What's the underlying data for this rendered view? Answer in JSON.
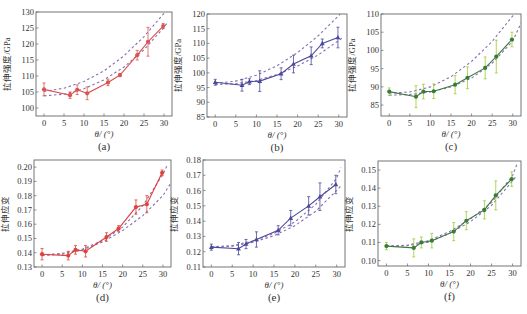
{
  "figure": {
    "xlabel": "θ/ (°)",
    "x_ticks": [
      0,
      5,
      10,
      15,
      20,
      25,
      30
    ],
    "x_range": [
      -2,
      32
    ]
  },
  "chart_data": [
    {
      "id": "a",
      "type": "line",
      "panel_label": "(a)",
      "ylabel": "拉伸强度/GPa",
      "xlabel": "θ/ (°)",
      "ylim": [
        97.5,
        130
      ],
      "y_ticks": [
        100,
        105,
        110,
        115,
        120,
        125,
        130
      ],
      "y_tick_decimals": 0,
      "color": "#d9534f",
      "marker": "circle",
      "frame": {
        "x": 36,
        "y": 12,
        "w": 136,
        "h": 104
      },
      "series": [
        {
          "name": "measured",
          "x": [
            0,
            6.5,
            8.3,
            10.8,
            16,
            19,
            23.3,
            26,
            29.8
          ],
          "values": [
            105.8,
            104.0,
            105.7,
            104.6,
            108.0,
            110.3,
            116.5,
            120.7,
            125.6
          ],
          "errors": [
            2.0,
            1.0,
            1.5,
            2.0,
            1.0,
            0.5,
            1.5,
            4.5,
            0.8
          ]
        },
        {
          "name": "fit-upper",
          "style": "dashed",
          "x": [
            0,
            5,
            10,
            15,
            20,
            25,
            30,
            31
          ],
          "values": [
            105.2,
            106.2,
            108.3,
            111.6,
            116.3,
            122.3,
            129.6,
            131
          ]
        },
        {
          "name": "fit-lower",
          "style": "dashed",
          "x": [
            0,
            5,
            10,
            15,
            20,
            25,
            30,
            31
          ],
          "values": [
            103.8,
            104.3,
            106.0,
            108.8,
            112.8,
            118.2,
            125.2,
            127
          ]
        }
      ]
    },
    {
      "id": "b",
      "type": "line",
      "panel_label": "(b)",
      "ylabel": "拉伸强度/GPa",
      "xlabel": "θ/ (°)",
      "ylim": [
        85,
        120
      ],
      "y_ticks": [
        85,
        90,
        95,
        100,
        105,
        110,
        115,
        120
      ],
      "y_tick_decimals": 0,
      "color": "#4a4a9c",
      "marker": "triangle",
      "frame": {
        "x": 207,
        "y": 14,
        "w": 140,
        "h": 103
      },
      "series": [
        {
          "name": "measured",
          "x": [
            0,
            6.5,
            8.3,
            10.8,
            16,
            19,
            23.3,
            26,
            29.8
          ],
          "values": [
            96.8,
            95.8,
            97.0,
            97.2,
            99.7,
            103.0,
            105.8,
            110.0,
            112.0
          ],
          "errors": [
            1.0,
            2.0,
            1.0,
            3.5,
            2.0,
            3.0,
            3.0,
            1.5,
            3.5
          ]
        },
        {
          "name": "fit-upper",
          "style": "dashed",
          "x": [
            0,
            5,
            10,
            15,
            20,
            25,
            30,
            31
          ],
          "values": [
            96.5,
            97.2,
            99.2,
            102.4,
            106.9,
            112.6,
            119.5,
            121
          ]
        },
        {
          "name": "fit-lower",
          "style": "dashed",
          "x": [
            0,
            5,
            10,
            15,
            20,
            25,
            30,
            31
          ],
          "values": [
            96.0,
            96.3,
            97.4,
            99.4,
            102.3,
            106.1,
            111.0,
            112
          ]
        }
      ]
    },
    {
      "id": "c",
      "type": "line",
      "panel_label": "(c)",
      "ylabel": "拉伸强度/GPa",
      "xlabel": "θ/ (°)",
      "ylim": [
        82,
        110
      ],
      "y_ticks": [
        85,
        90,
        95,
        100,
        105,
        110
      ],
      "y_tick_decimals": 0,
      "color": "#3a7a3a",
      "errcolor": "#9acd32",
      "marker": "circle",
      "frame": {
        "x": 381,
        "y": 14,
        "w": 140,
        "h": 102
      },
      "series": [
        {
          "name": "measured",
          "x": [
            0,
            6.5,
            8.3,
            10.8,
            16,
            19,
            23.3,
            26,
            29.8
          ],
          "values": [
            88.7,
            87.3,
            88.7,
            88.8,
            90.6,
            92.5,
            95.2,
            98.3,
            103.0
          ],
          "errors": [
            1.0,
            3.0,
            2.0,
            2.0,
            2.5,
            3.0,
            3.0,
            4.5,
            2.0
          ]
        },
        {
          "name": "fit-upper",
          "style": "dashed",
          "x": [
            0,
            5,
            10,
            15,
            20,
            25,
            30,
            31
          ],
          "values": [
            88.3,
            88.6,
            90.0,
            92.8,
            97.0,
            102.5,
            109.5,
            111
          ]
        },
        {
          "name": "fit-lower",
          "style": "dashed",
          "x": [
            0,
            5,
            10,
            15,
            20,
            25,
            30,
            32
          ],
          "values": [
            87.7,
            87.9,
            88.6,
            90.0,
            92.4,
            96.5,
            102.6,
            107.5
          ]
        }
      ]
    },
    {
      "id": "d",
      "type": "line",
      "panel_label": "(d)",
      "ylabel": "拉伸应变",
      "xlabel": "θ/ (°)",
      "ylim": [
        0.13,
        0.205
      ],
      "y_ticks": [
        0.13,
        0.14,
        0.15,
        0.16,
        0.17,
        0.18,
        0.19,
        0.2
      ],
      "y_tick_decimals": 2,
      "color": "#e0413a",
      "marker": "circle",
      "frame": {
        "x": 34,
        "y": 160,
        "w": 137,
        "h": 107
      },
      "series": [
        {
          "name": "measured",
          "x": [
            0,
            6.5,
            8.3,
            10.8,
            16,
            19,
            23.3,
            26,
            29.8
          ],
          "values": [
            0.139,
            0.138,
            0.142,
            0.141,
            0.151,
            0.157,
            0.172,
            0.174,
            0.196
          ],
          "errors": [
            0.004,
            0.003,
            0.003,
            0.004,
            0.003,
            0.002,
            0.005,
            0.006,
            0.002
          ]
        },
        {
          "name": "fit-upper",
          "style": "dashed",
          "x": [
            0,
            5,
            10,
            15,
            20,
            25,
            30,
            31
          ],
          "values": [
            0.1385,
            0.1395,
            0.1425,
            0.1485,
            0.158,
            0.173,
            0.195,
            0.201
          ]
        },
        {
          "name": "fit-lower",
          "style": "dashed",
          "x": [
            0,
            5,
            10,
            15,
            20,
            25,
            30,
            32
          ],
          "values": [
            0.138,
            0.139,
            0.142,
            0.1475,
            0.1555,
            0.166,
            0.18,
            0.189
          ]
        }
      ]
    },
    {
      "id": "e",
      "type": "line",
      "panel_label": "(e)",
      "ylabel": "拉伸应变",
      "xlabel": "θ/ (°)",
      "ylim": [
        0.11,
        0.18
      ],
      "y_ticks": [
        0.11,
        0.12,
        0.13,
        0.14,
        0.15,
        0.16,
        0.17,
        0.18
      ],
      "y_tick_decimals": 2,
      "color": "#4a4a9c",
      "marker": "triangle",
      "frame": {
        "x": 203,
        "y": 160,
        "w": 142,
        "h": 107
      },
      "series": [
        {
          "name": "measured",
          "x": [
            0,
            6.5,
            8.3,
            10.8,
            16,
            19,
            23.3,
            26,
            29.8
          ],
          "values": [
            0.123,
            0.122,
            0.125,
            0.128,
            0.134,
            0.142,
            0.15,
            0.156,
            0.164
          ],
          "errors": [
            0.002,
            0.004,
            0.003,
            0.005,
            0.003,
            0.005,
            0.006,
            0.009,
            0.006
          ]
        },
        {
          "name": "fit-upper",
          "style": "dashed",
          "x": [
            0,
            5,
            10,
            15,
            20,
            25,
            30,
            31
          ],
          "values": [
            0.1232,
            0.124,
            0.127,
            0.132,
            0.1395,
            0.151,
            0.168,
            0.175
          ]
        },
        {
          "name": "fit-lower",
          "style": "dashed",
          "x": [
            0,
            5,
            10,
            15,
            20,
            25,
            30,
            31
          ],
          "values": [
            0.1228,
            0.1236,
            0.1262,
            0.1305,
            0.137,
            0.1465,
            0.16,
            0.163
          ]
        }
      ]
    },
    {
      "id": "f",
      "type": "line",
      "panel_label": "(f)",
      "ylabel": "拉伸应变",
      "xlabel": "θ/ (°)",
      "ylim": [
        0.097,
        0.155
      ],
      "y_ticks": [
        0.1,
        0.11,
        0.12,
        0.13,
        0.14,
        0.15
      ],
      "y_tick_decimals": 2,
      "color": "#3a7a3a",
      "errcolor": "#9acd32",
      "marker": "circle",
      "frame": {
        "x": 378,
        "y": 161,
        "w": 143,
        "h": 105
      },
      "series": [
        {
          "name": "measured",
          "x": [
            0,
            6.5,
            8.3,
            10.8,
            16,
            19,
            23.3,
            26,
            29.8
          ],
          "values": [
            0.108,
            0.107,
            0.11,
            0.111,
            0.116,
            0.122,
            0.128,
            0.136,
            0.145
          ],
          "errors": [
            0.002,
            0.005,
            0.003,
            0.004,
            0.005,
            0.005,
            0.005,
            0.008,
            0.004
          ]
        },
        {
          "name": "fit-upper",
          "style": "dashed",
          "x": [
            0,
            5,
            10,
            15,
            20,
            25,
            30,
            31
          ],
          "values": [
            0.108,
            0.1085,
            0.111,
            0.116,
            0.123,
            0.132,
            0.147,
            0.153
          ]
        },
        {
          "name": "fit-lower",
          "style": "dashed",
          "x": [
            0,
            5,
            10,
            15,
            20,
            25,
            30,
            31
          ],
          "values": [
            0.1078,
            0.1082,
            0.1102,
            0.115,
            0.1215,
            0.1305,
            0.144,
            0.147
          ]
        }
      ]
    }
  ]
}
